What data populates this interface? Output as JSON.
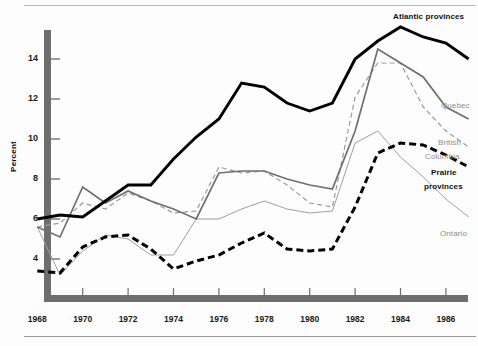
{
  "figure": {
    "y_axis_title": "Percent",
    "background": "#ffffff"
  },
  "chart_data": {
    "type": "line",
    "title": "",
    "subtitle": "",
    "xlabel": "",
    "ylabel": "Percent",
    "xlim": [
      1968,
      1987
    ],
    "ylim": [
      2.4,
      15.8
    ],
    "grid": false,
    "legend_position": "right-inline-labels",
    "x_tick_labels": [
      "1968",
      "1970",
      "1972",
      "1974",
      "1976",
      "1978",
      "1980",
      "1982",
      "1984",
      "1986"
    ],
    "x_ticks": [
      1968,
      1970,
      1972,
      1974,
      1976,
      1978,
      1980,
      1982,
      1984,
      1986
    ],
    "y_tick_labels": [
      "4",
      "6",
      "8",
      "10",
      "12",
      "14"
    ],
    "y_ticks": [
      4,
      6,
      8,
      10,
      12,
      14
    ],
    "x": [
      1968,
      1969,
      1970,
      1971,
      1972,
      1973,
      1974,
      1975,
      1976,
      1977,
      1978,
      1979,
      1980,
      1981,
      1982,
      1983,
      1984,
      1985,
      1986,
      1987
    ],
    "series": [
      {
        "name": "Atlantic provinces",
        "label": "Atlantic provinces",
        "color": "#000000",
        "style": "solid-thick",
        "values": [
          6.0,
          6.2,
          6.1,
          6.9,
          7.7,
          7.7,
          9.0,
          10.1,
          11.0,
          12.8,
          12.6,
          11.8,
          11.4,
          11.8,
          14.0,
          14.9,
          15.6,
          15.1,
          14.8,
          14.0
        ]
      },
      {
        "name": "Quebec",
        "label": "Quebec",
        "color": "#6f6f6f",
        "style": "solid-medium",
        "values": [
          5.6,
          5.1,
          7.6,
          6.8,
          7.4,
          6.9,
          6.5,
          6.0,
          8.3,
          8.4,
          8.4,
          8.0,
          7.7,
          7.5,
          10.4,
          14.5,
          13.8,
          13.1,
          11.6,
          11.0
        ]
      },
      {
        "name": "British Columbia",
        "label": "British Columbia",
        "color": "#9a9a9a",
        "style": "dashed-thin",
        "values": [
          5.6,
          5.8,
          6.8,
          6.5,
          7.3,
          6.9,
          6.3,
          6.4,
          8.6,
          8.3,
          8.4,
          7.7,
          6.8,
          6.6,
          12.1,
          13.8,
          13.8,
          11.6,
          10.4,
          9.6
        ]
      },
      {
        "name": "Prairie provinces",
        "label": "Prairie provinces",
        "color": "#000000",
        "style": "dashed-thick",
        "values": [
          3.4,
          3.3,
          4.6,
          5.1,
          5.2,
          4.5,
          3.5,
          3.9,
          4.2,
          4.8,
          5.3,
          4.5,
          4.4,
          4.5,
          6.6,
          9.3,
          9.8,
          9.7,
          9.2,
          8.6
        ]
      },
      {
        "name": "Ontario",
        "label": "Ontario",
        "color": "#9e9e9e",
        "style": "solid-thin",
        "values": [
          5.6,
          3.2,
          4.4,
          5.2,
          5.0,
          4.2,
          4.2,
          6.0,
          6.0,
          6.5,
          6.9,
          6.5,
          6.3,
          6.4,
          9.8,
          10.4,
          9.1,
          8.1,
          7.0,
          6.1
        ]
      }
    ]
  }
}
